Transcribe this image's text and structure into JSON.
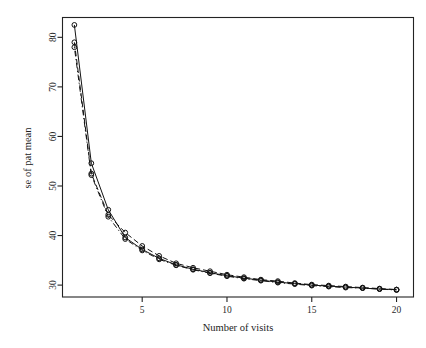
{
  "chart_data": {
    "type": "line",
    "title": "",
    "subtitle": "",
    "xlabel": "Number of visits",
    "ylabel": "se of pat mean",
    "xlim": [
      0.3,
      21.0
    ],
    "ylim": [
      27.6,
      84.0
    ],
    "xticks": [
      5,
      10,
      15,
      20
    ],
    "xticklabels": [
      "5",
      "10",
      "15",
      "20"
    ],
    "yticks": [
      30,
      40,
      50,
      60,
      70,
      80
    ],
    "yticklabels": [
      "30",
      "40",
      "50",
      "60",
      "70",
      "80"
    ],
    "grid": false,
    "legend": "none",
    "marker": "open-circle",
    "x": [
      1,
      2,
      3,
      4,
      5,
      6,
      7,
      8,
      9,
      10,
      11,
      12,
      13,
      14,
      15,
      16,
      17,
      18,
      19,
      20
    ],
    "series": [
      {
        "name": "series-1",
        "linestyle": "solid",
        "values": [
          82.5,
          54.6,
          45.2,
          39.6,
          37.2,
          35.4,
          34.1,
          33.2,
          32.5,
          31.9,
          31.4,
          31.0,
          30.6,
          30.3,
          30.0,
          29.8,
          29.6,
          29.4,
          29.2,
          29.1
        ]
      },
      {
        "name": "series-2",
        "linestyle": "dashed",
        "values": [
          79.0,
          52.5,
          44.2,
          40.6,
          37.9,
          35.9,
          34.4,
          33.5,
          32.8,
          32.1,
          31.6,
          31.1,
          30.8,
          30.4,
          30.1,
          29.9,
          29.7,
          29.5,
          29.3,
          29.1
        ]
      },
      {
        "name": "series-3",
        "linestyle": "dotdash",
        "values": [
          78.0,
          52.2,
          43.8,
          39.3,
          37.0,
          35.2,
          34.0,
          33.1,
          32.4,
          31.8,
          31.3,
          30.9,
          30.5,
          30.2,
          29.9,
          29.7,
          29.5,
          29.4,
          29.2,
          29.0
        ]
      }
    ]
  },
  "colors": {
    "ink": "#121212",
    "axis": "#232323",
    "background": "#ffffff"
  }
}
